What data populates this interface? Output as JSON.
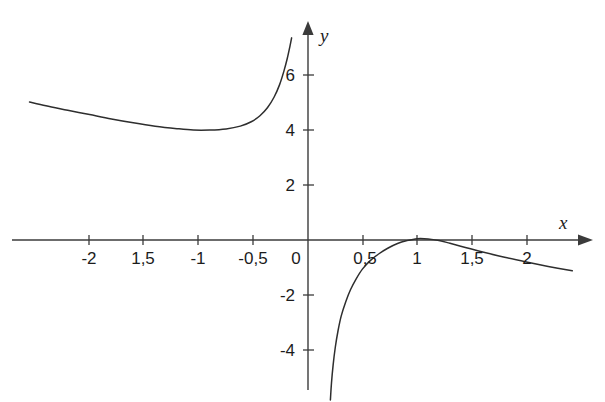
{
  "chart_data": {
    "type": "line",
    "title": "",
    "subtitle": "",
    "xlabel": "x",
    "ylabel": "y",
    "xlim": [
      -2.82,
      2.72
    ],
    "ylim": [
      -5.82,
      7.35
    ],
    "grid": false,
    "legend": null,
    "annotations": [],
    "decimal_separator": ",",
    "axis_labels": {
      "x_axis_name": "x",
      "y_axis_name": "y"
    },
    "x_ticks": [
      {
        "value": -2.0,
        "label": "-2"
      },
      {
        "value": -1.5,
        "label": "1,5"
      },
      {
        "value": -1.0,
        "label": "-1"
      },
      {
        "value": -0.5,
        "label": "-0,5"
      },
      {
        "value": 0.0,
        "label": "0"
      },
      {
        "value": 0.5,
        "label": "0,5"
      },
      {
        "value": 1.0,
        "label": "1"
      },
      {
        "value": 1.5,
        "label": "1,5"
      },
      {
        "value": 2.0,
        "label": "2"
      }
    ],
    "y_ticks": [
      {
        "value": 6,
        "label": "6"
      },
      {
        "value": 4,
        "label": "4"
      },
      {
        "value": 2,
        "label": "2"
      },
      {
        "value": -2,
        "label": "-2"
      },
      {
        "value": -4,
        "label": "-4"
      }
    ],
    "series": [
      {
        "name": "left-branch",
        "description": "Branch for x < 0: enters at upper left near y=5, dips to a minimum of about y=4 near x=-1, then rises steeply to +infinity as x approaches 0 from the left.",
        "points": [
          {
            "x": -2.55,
            "y": 5.02
          },
          {
            "x": -2.4,
            "y": 4.88
          },
          {
            "x": -2.2,
            "y": 4.72
          },
          {
            "x": -2.0,
            "y": 4.56
          },
          {
            "x": -1.8,
            "y": 4.4
          },
          {
            "x": -1.6,
            "y": 4.26
          },
          {
            "x": -1.4,
            "y": 4.14
          },
          {
            "x": -1.2,
            "y": 4.05
          },
          {
            "x": -1.05,
            "y": 4.0
          },
          {
            "x": -0.9,
            "y": 4.0
          },
          {
            "x": -0.75,
            "y": 4.04
          },
          {
            "x": -0.62,
            "y": 4.14
          },
          {
            "x": -0.52,
            "y": 4.3
          },
          {
            "x": -0.44,
            "y": 4.52
          },
          {
            "x": -0.37,
            "y": 4.82
          },
          {
            "x": -0.31,
            "y": 5.2
          },
          {
            "x": -0.26,
            "y": 5.65
          },
          {
            "x": -0.22,
            "y": 6.15
          },
          {
            "x": -0.19,
            "y": 6.6
          },
          {
            "x": -0.165,
            "y": 7.05
          },
          {
            "x": -0.15,
            "y": 7.35
          }
        ]
      },
      {
        "name": "right-branch",
        "description": "Branch for x > 0: comes up from -infinity near x=0, rises steeply, flattens and just touches a maximum of about y=0.1 near x=1, then decreases slowly, crossing y=0 near x=1.25 and reaching about y=-1.1 at x=2.4.",
        "points": [
          {
            "x": 0.205,
            "y": -5.82
          },
          {
            "x": 0.215,
            "y": -5.2
          },
          {
            "x": 0.23,
            "y": -4.55
          },
          {
            "x": 0.25,
            "y": -3.9
          },
          {
            "x": 0.275,
            "y": -3.3
          },
          {
            "x": 0.305,
            "y": -2.75
          },
          {
            "x": 0.345,
            "y": -2.25
          },
          {
            "x": 0.39,
            "y": -1.8
          },
          {
            "x": 0.44,
            "y": -1.42
          },
          {
            "x": 0.5,
            "y": -1.05
          },
          {
            "x": 0.57,
            "y": -0.75
          },
          {
            "x": 0.65,
            "y": -0.5
          },
          {
            "x": 0.73,
            "y": -0.3
          },
          {
            "x": 0.82,
            "y": -0.13
          },
          {
            "x": 0.9,
            "y": -0.03
          },
          {
            "x": 1.0,
            "y": 0.05
          },
          {
            "x": 1.1,
            "y": 0.04
          },
          {
            "x": 1.2,
            "y": -0.02
          },
          {
            "x": 1.3,
            "y": -0.12
          },
          {
            "x": 1.45,
            "y": -0.28
          },
          {
            "x": 1.6,
            "y": -0.44
          },
          {
            "x": 1.8,
            "y": -0.63
          },
          {
            "x": 2.0,
            "y": -0.8
          },
          {
            "x": 2.2,
            "y": -0.96
          },
          {
            "x": 2.42,
            "y": -1.12
          }
        ]
      }
    ],
    "colors": {
      "background": "#ffffff",
      "curve": "#2e2e2e",
      "axis": "#3b3b3b",
      "text": "#1c1c1c"
    }
  }
}
